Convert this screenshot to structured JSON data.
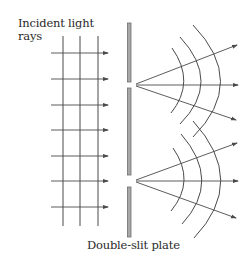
{
  "labels": {
    "incident_line1": "Incident light",
    "incident_line2": "rays",
    "plate": "Double-slit plate"
  },
  "colors": {
    "line": "#4a4a4a",
    "plate_fill": "#a8a8a8",
    "plate_stroke": "#6e6e6e",
    "text": "#2a2a2a"
  },
  "diagram": {
    "incident_wavefronts_x": [
      63,
      80,
      98
    ],
    "incident_ray_y": [
      53,
      79,
      105,
      130,
      156,
      181,
      207
    ],
    "plate_segments": [
      {
        "y_top": 23,
        "y_bottom": 82
      },
      {
        "y_top": 88,
        "y_bottom": 175
      },
      {
        "y_top": 187,
        "y_bottom": 237
      }
    ],
    "slits": [
      {
        "name": "upper-slit",
        "center_y": 85
      },
      {
        "name": "lower-slit",
        "center_y": 181
      }
    ],
    "diffracted_wavefronts_per_slit": 3,
    "diffracted_rays_per_slit": 3
  }
}
